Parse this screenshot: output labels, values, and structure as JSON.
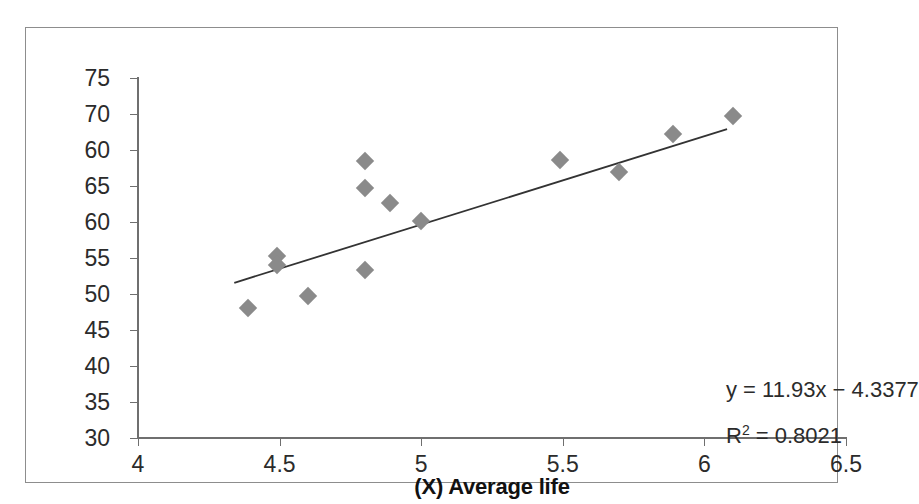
{
  "chart_data": {
    "type": "scatter",
    "title": "",
    "xlabel": "(X) Average life",
    "ylabel": "(Y) Spread bps",
    "xlim": [
      4,
      6.5
    ],
    "ylim": [
      30,
      75
    ],
    "grid": false,
    "legend": "none",
    "x_ticks": [
      "4",
      "4.5",
      "5",
      "5.5",
      "6",
      "6.5"
    ],
    "x_tick_values": [
      4,
      4.5,
      5,
      5.5,
      6,
      6.5
    ],
    "y_ticks": [
      "75",
      "70",
      "60",
      "65",
      "60",
      "55",
      "50",
      "45",
      "40",
      "35",
      "30"
    ],
    "y_tick_values": [
      75,
      70,
      65,
      60,
      55,
      50,
      45,
      40,
      35,
      30
    ],
    "marker_color": "#8a8a8a",
    "marker_shape": "diamond",
    "line_color": "#333333",
    "points": [
      {
        "x": 4.39,
        "y": 46.2
      },
      {
        "x": 4.49,
        "y": 52.7
      },
      {
        "x": 4.49,
        "y": 51.6
      },
      {
        "x": 4.6,
        "y": 47.8
      },
      {
        "x": 4.8,
        "y": 64.6
      },
      {
        "x": 4.8,
        "y": 61.3
      },
      {
        "x": 4.8,
        "y": 51.0
      },
      {
        "x": 4.89,
        "y": 59.4
      },
      {
        "x": 5.0,
        "y": 57.1
      },
      {
        "x": 5.49,
        "y": 64.7
      },
      {
        "x": 5.7,
        "y": 63.3
      },
      {
        "x": 5.89,
        "y": 68.0
      },
      {
        "x": 6.1,
        "y": 70.2
      }
    ],
    "trendline": {
      "x_start": 4.34,
      "y_start": 49.4,
      "x_end": 6.08,
      "y_end": 68.6,
      "slope": 11.93,
      "intercept": -4.3377
    },
    "annotations": {
      "equation_y": "y",
      "equation_eq": "=",
      "equation_body": "11.93x − 4.3377",
      "equation_full": "y = 11.93x − 4.3377",
      "r_squared_label": "R",
      "r_squared_sup": "2",
      "r_squared_value": "= 0.8021",
      "r_squared_full": "R2 = 0.8021"
    }
  }
}
